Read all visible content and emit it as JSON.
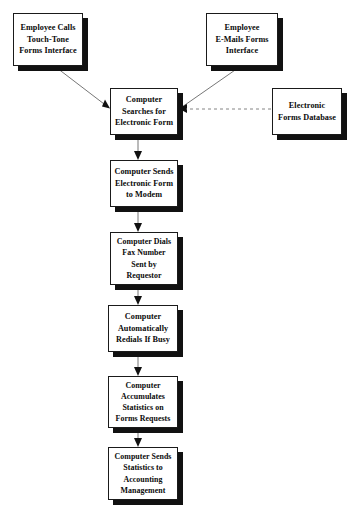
{
  "diagram": {
    "background_color": "#ffffff",
    "box_fill_color": "#ffffff",
    "box_border_color": "#1a1a1a",
    "box_shadow_color": "#111111",
    "connector_color": "#555555",
    "nodes": [
      {
        "id": "employee-calls",
        "label": "Employee Calls\nTouch-Tone\nForms Interface",
        "x": 13,
        "y": 13,
        "w": 70,
        "h": 53
      },
      {
        "id": "employee-emails",
        "label": "Employee\nE-Mails Forms\nInterface",
        "x": 206,
        "y": 13,
        "w": 72,
        "h": 53
      },
      {
        "id": "computer-searches",
        "label": "Computer\nSearches for\nElectronic Form",
        "x": 110,
        "y": 88,
        "w": 68,
        "h": 47
      },
      {
        "id": "electronic-forms-database",
        "label": "Electronic\nForms Database",
        "x": 272,
        "y": 88,
        "w": 70,
        "h": 47
      },
      {
        "id": "computer-sends-modem",
        "label": "Computer Sends\nElectronic Form\nto Modem",
        "x": 110,
        "y": 160,
        "w": 68,
        "h": 47
      },
      {
        "id": "computer-dials-fax",
        "label": "Computer Dials\nFax Number\nSent  by\nRequestor",
        "x": 110,
        "y": 232,
        "w": 68,
        "h": 53
      },
      {
        "id": "computer-redials",
        "label": "Computer\nAutomatically\nRedials If Busy",
        "x": 108,
        "y": 305,
        "w": 70,
        "h": 47
      },
      {
        "id": "computer-accumulates",
        "label": "Computer\nAccumulates\nStatistics on\nForms Requests",
        "x": 108,
        "y": 376,
        "w": 70,
        "h": 52
      },
      {
        "id": "computer-sends-statistics",
        "label": "Computer Sends\nStatistics to\nAccounting\nManagement",
        "x": 108,
        "y": 447,
        "w": 70,
        "h": 53
      }
    ],
    "connectors": [
      {
        "id": "calls-to-searches",
        "style": "solid",
        "arrow": "end",
        "from": "employee-calls",
        "to": "computer-searches"
      },
      {
        "id": "emails-to-searches",
        "style": "solid",
        "arrow": "end",
        "from": "employee-emails",
        "to": "computer-searches"
      },
      {
        "id": "database-to-searches",
        "style": "dashed",
        "arrow": "end",
        "from": "electronic-forms-database",
        "to": "computer-searches"
      },
      {
        "id": "searches-to-modem",
        "style": "solid",
        "arrow": "end",
        "from": "computer-searches",
        "to": "computer-sends-modem"
      },
      {
        "id": "modem-to-dials",
        "style": "solid",
        "arrow": "end",
        "from": "computer-sends-modem",
        "to": "computer-dials-fax"
      },
      {
        "id": "dials-to-redials",
        "style": "solid",
        "arrow": "end",
        "from": "computer-dials-fax",
        "to": "computer-redials"
      },
      {
        "id": "redials-to-accumulates",
        "style": "solid",
        "arrow": "end",
        "from": "computer-redials",
        "to": "computer-accumulates"
      },
      {
        "id": "accumulates-to-statistics",
        "style": "solid",
        "arrow": "end",
        "from": "computer-accumulates",
        "to": "computer-sends-statistics"
      }
    ]
  }
}
